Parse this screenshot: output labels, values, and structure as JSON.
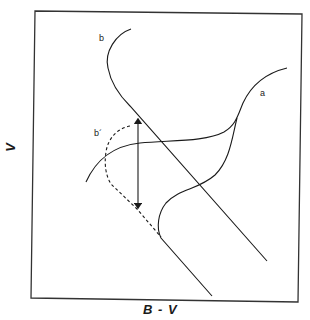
{
  "figure": {
    "type": "color-magnitude diagram sketch",
    "x_axis_label": "B - V",
    "y_axis_label": "V",
    "curves": [
      {
        "id": "a",
        "label": "a",
        "style": "solid",
        "description": "S-shaped sequence with upper and lower branches"
      },
      {
        "id": "b",
        "label": "b",
        "style": "solid",
        "description": "curve hooking into a straight diagonal sequence"
      },
      {
        "id": "b_prime",
        "label": "b´",
        "style": "dashed",
        "description": "shifted version of curve b"
      }
    ],
    "annotations": [
      {
        "type": "double-arrow",
        "orientation": "vertical",
        "description": "vertical offset between b and b´"
      }
    ],
    "colors": {
      "line": "#1a1a1a",
      "background": "#ffffff",
      "frame": "#333333"
    }
  }
}
